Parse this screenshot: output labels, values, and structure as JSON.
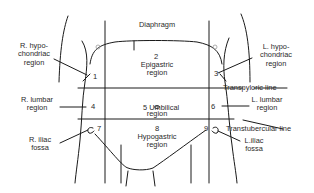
{
  "diagram": {
    "type": "anatomy-regions",
    "line_color": "#1a1a1a",
    "text_color": "#2a2a2a",
    "background": "#ffffff"
  },
  "top_label": "Diaphragm",
  "regions": [
    {
      "number": "1",
      "name": "R. hypochondriac region",
      "label_lines": "R. hypo-\nchondriac\nregion"
    },
    {
      "number": "2",
      "name": "Epigastric region",
      "label_lines": "Epigastric\nregion"
    },
    {
      "number": "3",
      "name": "L. hypochondriac region",
      "label_lines": "L. hypo-\nchondriac\nregion"
    },
    {
      "number": "4",
      "name": "R. lumbar region",
      "label_lines": "R. lumbar\nregion"
    },
    {
      "number": "5",
      "name": "Umbilical region",
      "label_lines": "Umbilical\nregion"
    },
    {
      "number": "6",
      "name": "L. lumbar region",
      "label_lines": "L. lumbar\nregion"
    },
    {
      "number": "7",
      "name": "R. iliac fossa",
      "label_lines": "R. iliac\nfossa"
    },
    {
      "number": "8",
      "name": "Hypogastric region",
      "label_lines": "Hypogastric\nregion"
    },
    {
      "number": "9",
      "name": "L. iliac fossa",
      "label_lines": "L.iliac\nfossa"
    }
  ],
  "lines": {
    "transpyloric": "Transpyloric line",
    "transtubercular": "Transtubercular line"
  }
}
